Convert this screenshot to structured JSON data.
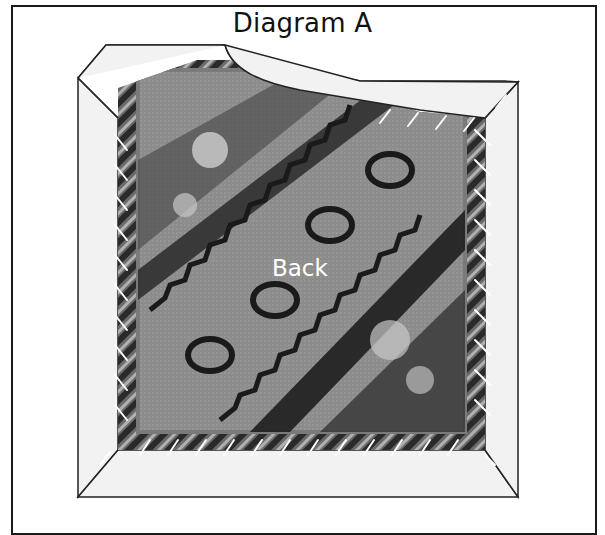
{
  "diagram": {
    "title": "Diagram A",
    "center_label": "Back",
    "elements": {
      "outer_frame": "border frame",
      "folded_flap": "top flap folded back with curved edge",
      "binding_border": "light fabric border around rug",
      "rug": "patterned rug back with diagonal geometric motifs",
      "stitches": "white diagonal stitch marks along all four edges",
      "mitered_corners": "diagonal mitered corners"
    },
    "colors": {
      "frame_line": "#1a1a1a",
      "binding_fill": "#f2f2f2",
      "rug_base": "#8a8a8a",
      "rug_dark": "#1e1e1e",
      "rug_light": "#c8c8c8",
      "stitch": "#ffffff",
      "label_text": "#ffffff"
    }
  }
}
